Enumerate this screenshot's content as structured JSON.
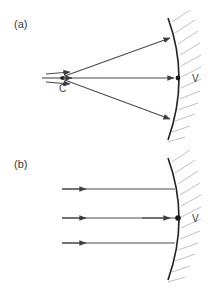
{
  "figure": {
    "panels": [
      {
        "id": "a",
        "label": "(a)",
        "description": "Rays diverging from center of curvature C strike the concave mirror and reflect back through C",
        "points": [
          {
            "name": "center-of-curvature",
            "label": "C",
            "x": 60,
            "y": 78
          },
          {
            "name": "vertex",
            "label": "V",
            "x": 178,
            "y": 78
          }
        ],
        "rays": [
          {
            "name": "upper-ray",
            "from": [
              62,
              77
            ],
            "to": [
              172,
              37
            ]
          },
          {
            "name": "axis-ray",
            "from": [
              62,
              78
            ],
            "to": [
              178,
              78
            ]
          },
          {
            "name": "lower-ray",
            "from": [
              62,
              79
            ],
            "to": [
              172,
              120
            ]
          }
        ],
        "mirror": {
          "name": "concave-mirror-arc",
          "top": [
            168,
            18
          ],
          "vertex": [
            178,
            78
          ],
          "bottom": [
            168,
            140
          ]
        }
      },
      {
        "id": "b",
        "label": "(b)",
        "description": "Parallel rays travelling toward the concave mirror along and parallel to the principal axis",
        "points": [
          {
            "name": "vertex",
            "label": "V",
            "x": 178,
            "y": 218
          }
        ],
        "rays": [
          {
            "name": "upper-parallel-ray",
            "from": [
              62,
              189
            ],
            "to": [
              175,
              189
            ]
          },
          {
            "name": "axis-parallel-ray",
            "from": [
              62,
              218
            ],
            "to": [
              178,
              218
            ]
          },
          {
            "name": "lower-parallel-ray",
            "from": [
              62,
              243
            ],
            "to": [
              175,
              243
            ]
          }
        ],
        "mirror": {
          "name": "concave-mirror-arc",
          "top": [
            168,
            158
          ],
          "vertex": [
            178,
            218
          ],
          "bottom": [
            168,
            280
          ]
        }
      }
    ],
    "colors": {
      "mirror_stroke": "#222222",
      "ray_stroke": "#4a4a4a",
      "hatch_stroke": "#b9b9b9",
      "text": "#3a3a3a",
      "background": "#ffffff"
    }
  }
}
